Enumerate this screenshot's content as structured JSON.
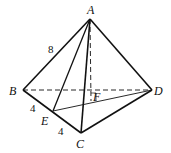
{
  "diagram": {
    "type": "tetrahedron",
    "vertices": {
      "A": {
        "label": "A",
        "x": 90,
        "y": 19
      },
      "B": {
        "label": "B",
        "x": 23,
        "y": 90
      },
      "C": {
        "label": "C",
        "x": 81,
        "y": 133
      },
      "D": {
        "label": "D",
        "x": 152,
        "y": 90
      },
      "E": {
        "label": "E",
        "x": 53,
        "y": 111
      },
      "F": {
        "label": "F",
        "x": 91,
        "y": 101
      }
    },
    "edge_labels": {
      "AB": "8",
      "BE": "4",
      "EC": "4"
    },
    "solid_edges": [
      "AB",
      "AC",
      "AD",
      "BC",
      "CD",
      "AE",
      "ED"
    ],
    "dashed_edges": [
      "BD",
      "AF"
    ],
    "right_angle_at": "F",
    "colors": {
      "stroke": "#111111",
      "background": "#ffffff"
    }
  }
}
